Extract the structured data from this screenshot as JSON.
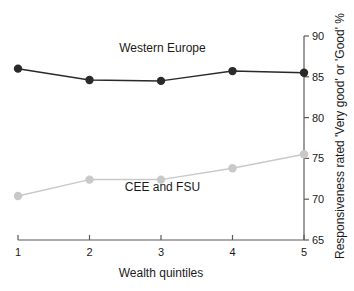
{
  "chart_data": {
    "type": "line",
    "title": "",
    "xlabel": "Wealth quintiles",
    "ylabel": "Responsiveness rated 'Very good' or 'Good' %",
    "categories": [
      "1",
      "2",
      "3",
      "4",
      "5"
    ],
    "x": [
      1,
      2,
      3,
      4,
      5
    ],
    "xlim": [
      1,
      5
    ],
    "ylim": [
      65,
      90
    ],
    "yticks": [
      65,
      70,
      75,
      80,
      85,
      90
    ],
    "xticks": [
      1,
      2,
      3,
      4,
      5
    ],
    "grid": false,
    "legend_position": "inline-annotation",
    "y_axis_side": "right",
    "series": [
      {
        "name": "Western Europe",
        "values": [
          86.0,
          84.6,
          84.5,
          85.7,
          85.5
        ],
        "color": "#2a2a2a",
        "marker": "circle",
        "label_x": 3.02,
        "label_y": 88.1
      },
      {
        "name": "CEE and FSU",
        "values": [
          70.4,
          72.4,
          72.4,
          73.8,
          75.5
        ],
        "color": "#c9c9c9",
        "marker": "circle",
        "label_x": 3.02,
        "label_y": 71.0
      }
    ]
  },
  "axis": {
    "y_tick_labels": [
      "65",
      "70",
      "75",
      "80",
      "85",
      "90"
    ],
    "x_tick_labels": [
      "1",
      "2",
      "3",
      "4",
      "5"
    ],
    "x_title": "Wealth quintiles",
    "y_title": "Responsiveness rated 'Very good' or 'Good' %"
  }
}
